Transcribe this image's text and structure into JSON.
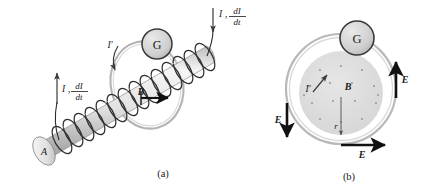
{
  "figure": {
    "title_alt": "Induced electric field of a solenoid",
    "panels": [
      {
        "id": "a",
        "caption": "(a)",
        "labels": {
          "rod_end": "A",
          "current_left": "I",
          "current_left_rate_num": "dI",
          "current_left_rate_den": "dt",
          "current_left_comma": ",",
          "current_right": "I",
          "current_right_rate_num": "dI",
          "current_right_rate_den": "dt",
          "current_right_comma": ",",
          "induced_current": "I'",
          "field": "B",
          "meter": "G"
        }
      },
      {
        "id": "b",
        "caption": "(b)",
        "labels": {
          "meter": "G",
          "field": "B",
          "radius": "r",
          "induced_current": "I'",
          "e_left": "E",
          "e_right": "E",
          "e_bottom": "E"
        }
      }
    ]
  },
  "colors": {
    "ink": "#1a1a1a",
    "coil_dark": "#2b2b2b",
    "rod_light": "#f2f2f2",
    "rod_mid": "#cfcfcf",
    "rod_shadow": "#9a9a9a",
    "ring_gray": "#b9b9b9",
    "meter_fill": "#d2d2d2",
    "field_fill": "#dcdcdc",
    "arrow_black": "#111111"
  }
}
